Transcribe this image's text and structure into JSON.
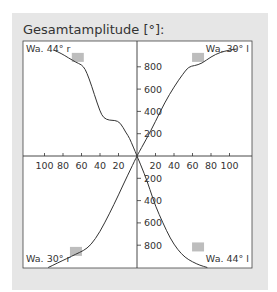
{
  "chart_data": {
    "type": "line",
    "title": "Gesamtamplitude [°]:",
    "xlabel": "",
    "ylabel": "",
    "x_ticks": [
      100,
      80,
      60,
      40,
      20,
      20,
      40,
      60,
      80,
      100
    ],
    "y_ticks_top": [
      800,
      600,
      400,
      200
    ],
    "y_ticks_bottom": [
      200,
      400,
      600,
      800
    ],
    "xlim": [
      -115,
      115
    ],
    "ylim": [
      -1000,
      1000
    ],
    "grid": false,
    "legend": "corner labels",
    "series": [
      {
        "name": "Wa. 44° r",
        "quadrant": "top-left",
        "points": [
          [
            0,
            0
          ],
          [
            4,
            80
          ],
          [
            8,
            160
          ],
          [
            12,
            210
          ],
          [
            18,
            300
          ],
          [
            24,
            320
          ],
          [
            30,
            320
          ],
          [
            36,
            340
          ],
          [
            40,
            400
          ],
          [
            46,
            550
          ],
          [
            52,
            700
          ],
          [
            56,
            780
          ],
          [
            60,
            820
          ],
          [
            66,
            840
          ],
          [
            74,
            880
          ],
          [
            82,
            920
          ],
          [
            90,
            950
          ]
        ]
      },
      {
        "name": "Wa. 30° l",
        "quadrant": "top-right",
        "points": [
          [
            0,
            0
          ],
          [
            10,
            150
          ],
          [
            20,
            310
          ],
          [
            30,
            480
          ],
          [
            40,
            620
          ],
          [
            50,
            740
          ],
          [
            56,
            800
          ],
          [
            62,
            810
          ],
          [
            70,
            830
          ],
          [
            80,
            890
          ],
          [
            90,
            930
          ],
          [
            100,
            950
          ],
          [
            108,
            960
          ]
        ]
      },
      {
        "name": "Wa. 30° r",
        "quadrant": "bottom-left",
        "points": [
          [
            0,
            0
          ],
          [
            10,
            -170
          ],
          [
            20,
            -350
          ],
          [
            30,
            -520
          ],
          [
            40,
            -680
          ],
          [
            50,
            -800
          ],
          [
            58,
            -850
          ],
          [
            66,
            -880
          ],
          [
            76,
            -920
          ],
          [
            86,
            -960
          ],
          [
            96,
            -1000
          ]
        ]
      },
      {
        "name": "Wa. 44° l",
        "quadrant": "bottom-right",
        "points": [
          [
            0,
            0
          ],
          [
            8,
            -160
          ],
          [
            14,
            -300
          ],
          [
            20,
            -450
          ],
          [
            28,
            -600
          ],
          [
            36,
            -740
          ],
          [
            44,
            -840
          ],
          [
            52,
            -910
          ],
          [
            60,
            -950
          ],
          [
            68,
            -980
          ],
          [
            76,
            -1000
          ]
        ]
      }
    ],
    "markers": [
      {
        "quadrant": "top-left",
        "x": 64,
        "y": 880
      },
      {
        "quadrant": "top-right",
        "x": 66,
        "y": 880
      },
      {
        "quadrant": "bottom-left",
        "x": 66,
        "y": -860
      },
      {
        "quadrant": "bottom-right",
        "x": 66,
        "y": -820
      }
    ]
  },
  "labels": {
    "title": "Gesamtamplitude [°]:",
    "top_left": "Wa. 44° r",
    "top_right": "Wa. 30° l",
    "bottom_left": "Wa. 30° r",
    "bottom_right": "Wa. 44° l"
  },
  "colors": {
    "panel": "#e6e6e6",
    "plot_bg": "#ffffff",
    "line": "#333333",
    "marker": "#bdbdbd"
  }
}
